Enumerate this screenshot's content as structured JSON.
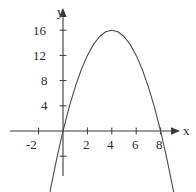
{
  "figure": {
    "background_color": "#ffffff",
    "axis_color": "#3a3a3a",
    "curve_color": "#4a4a4a",
    "label_color": "#2b2b2b",
    "width": 196,
    "height": 192
  },
  "axes": {
    "x_name": "x",
    "y_name": "y",
    "x_tick_labels": [
      "-2",
      "2",
      "4",
      "6",
      "8"
    ],
    "y_tick_labels": [
      "16",
      "12",
      "8",
      "4"
    ]
  },
  "chart_data": {
    "type": "line",
    "title": "",
    "subtitle": "",
    "xlabel": "x",
    "ylabel": "y",
    "grid": false,
    "legend": null,
    "xlim": [
      -3.2,
      9.8
    ],
    "ylim": [
      -10.5,
      19.5
    ],
    "xticks": [
      -2,
      2,
      4,
      6,
      8
    ],
    "xtick_labels": [
      "-2",
      "2",
      "4",
      "6",
      "8"
    ],
    "yticks": [
      4,
      8,
      12,
      16
    ],
    "ytick_labels": [
      "4",
      "8",
      "12",
      "16"
    ],
    "extra_yticks": [
      -4
    ],
    "series": [
      {
        "name": "parabola",
        "equation": "y = -x^2 + 8x",
        "vertex": [
          4,
          16
        ],
        "roots": [
          0,
          8
        ],
        "x": [
          -1.5,
          -1.0,
          -0.5,
          0,
          0.5,
          1,
          1.5,
          2,
          2.5,
          3,
          3.5,
          4,
          4.5,
          5,
          5.5,
          6,
          6.5,
          7,
          7.5,
          8,
          8.5,
          9,
          9.3
        ],
        "values": [
          -14.25,
          -9,
          -4.25,
          0,
          3.75,
          7,
          9.75,
          12,
          13.75,
          15,
          15.75,
          16,
          15.75,
          15,
          13.75,
          12,
          9.75,
          7,
          3.75,
          0,
          -4.25,
          -9,
          -12.09
        ]
      }
    ]
  }
}
